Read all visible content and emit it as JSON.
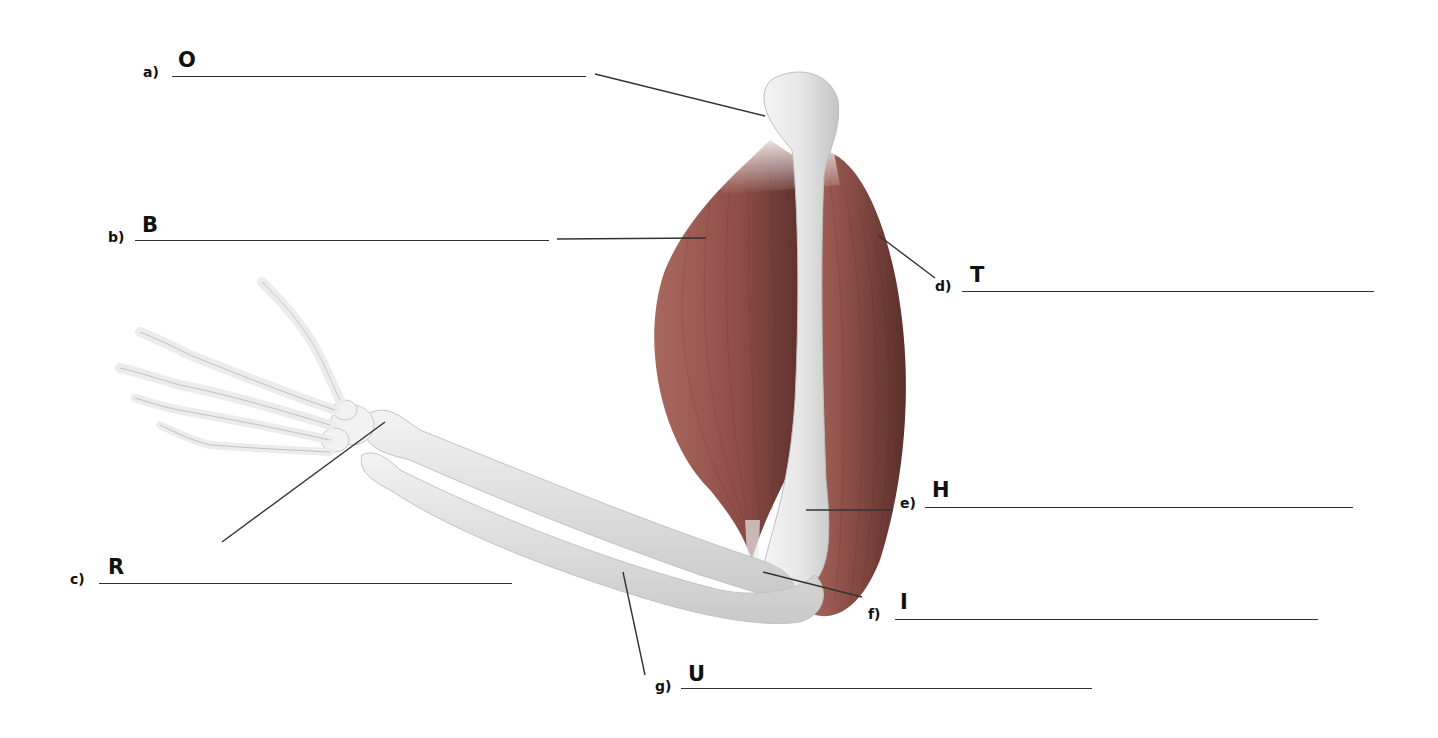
{
  "diagram": {
    "colors": {
      "muscle": "#9b5a52",
      "muscle_dark": "#6e3a35",
      "bone": "#ececec",
      "bone_shadow": "#bdbdbd",
      "leader_line": "#333333"
    },
    "labels": [
      {
        "id": "a",
        "letter": "a)",
        "initial": "O",
        "answer": ""
      },
      {
        "id": "b",
        "letter": "b)",
        "initial": "B",
        "answer": ""
      },
      {
        "id": "c",
        "letter": "c)",
        "initial": "R",
        "answer": ""
      },
      {
        "id": "d",
        "letter": "d)",
        "initial": "T",
        "answer": ""
      },
      {
        "id": "e",
        "letter": "e)",
        "initial": "H",
        "answer": ""
      },
      {
        "id": "f",
        "letter": "f)",
        "initial": "I",
        "answer": ""
      },
      {
        "id": "g",
        "letter": "g)",
        "initial": "U",
        "answer": ""
      }
    ]
  }
}
